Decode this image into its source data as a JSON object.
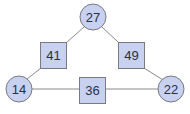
{
  "diagram": {
    "type": "number-triangle",
    "colors": {
      "node_fill": "#c8d2f0",
      "node_stroke": "#7a7a80",
      "edge": "#8a8a8a",
      "text": "#2a2f45"
    },
    "circles": [
      {
        "id": "top",
        "label": "27"
      },
      {
        "id": "left",
        "label": "14"
      },
      {
        "id": "right",
        "label": "22"
      }
    ],
    "squares": [
      {
        "id": "top-left",
        "label": "41"
      },
      {
        "id": "top-right",
        "label": "49"
      },
      {
        "id": "bottom",
        "label": "36"
      }
    ],
    "edges": [
      {
        "from": "top",
        "to": "top-left"
      },
      {
        "from": "top-left",
        "to": "left"
      },
      {
        "from": "top",
        "to": "top-right"
      },
      {
        "from": "top-right",
        "to": "right"
      },
      {
        "from": "left",
        "to": "bottom"
      },
      {
        "from": "bottom",
        "to": "right"
      }
    ]
  }
}
